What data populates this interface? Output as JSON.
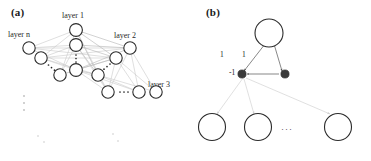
{
  "figure": {
    "type": "diagram",
    "background_color": "#ffffff",
    "ink_color": "#1a1a1a",
    "edge_color": "#c9c9c9",
    "node_fill": "#ffffff",
    "node_stroke": "#2b2b2b",
    "filled_node_color": "#3b3b3b"
  },
  "panels": [
    {
      "id": "a",
      "label": "(a)",
      "layer_labels": [
        {
          "id": "layer-1",
          "text": "layer 1",
          "x": 62,
          "y": 11
        },
        {
          "id": "layer-n",
          "text": "layer n",
          "x": 8,
          "y": 30
        },
        {
          "id": "layer-2",
          "text": "layer 2",
          "x": 114,
          "y": 31
        },
        {
          "id": "layer-3",
          "text": "layer 3",
          "x": 148,
          "y": 80
        }
      ],
      "ellipses": [
        {
          "id": "layer-n-ellipsis",
          "orientation": "diagonal"
        },
        {
          "id": "layer-1-ellipsis",
          "orientation": "vertical"
        },
        {
          "id": "layer-2-ellipsis",
          "orientation": "diagonal"
        },
        {
          "id": "layer-3-ellipsis",
          "orientation": "horizontal"
        },
        {
          "id": "more-layers-ellipsis",
          "orientation": "vertical"
        }
      ],
      "node_count": 12
    },
    {
      "id": "b",
      "label": "(b)",
      "weights": [
        {
          "id": "weight-left",
          "text": "1",
          "x": 220,
          "y": 55
        },
        {
          "id": "weight-right",
          "text": "1",
          "x": 242,
          "y": 55
        },
        {
          "id": "weight-inhibit",
          "text": "-1",
          "x": 229,
          "y": 73
        }
      ],
      "ellipsis": {
        "id": "output-ellipsis",
        "text": "···",
        "x": 142,
        "y": 125
      },
      "node_count": 6
    }
  ]
}
